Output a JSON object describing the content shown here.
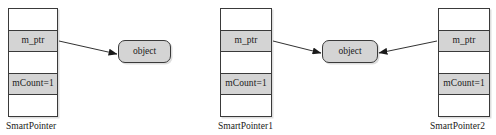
{
  "diagram": {
    "colors": {
      "fill_gray": "#d4d4d4",
      "stroke": "#3a3a3a",
      "background": "#ffffff",
      "text": "#1a1a1a"
    },
    "figures": [
      {
        "id": "single-owner",
        "caption": "SmartPointer",
        "box": {
          "rows": [
            {
              "label": "",
              "filled": false
            },
            {
              "label": "m_ptr",
              "filled": true
            },
            {
              "label": "",
              "filled": false
            },
            {
              "label": "mCount=1",
              "filled": true
            },
            {
              "label": "",
              "filled": false
            }
          ]
        },
        "object": {
          "label": "object"
        }
      },
      {
        "id": "shared-owner",
        "captions": {
          "left": "SmartPointer1",
          "right": "SmartPointer2"
        },
        "box_left": {
          "rows": [
            {
              "label": "",
              "filled": false
            },
            {
              "label": "m_ptr",
              "filled": true
            },
            {
              "label": "",
              "filled": false
            },
            {
              "label": "mCount=1",
              "filled": true
            },
            {
              "label": "",
              "filled": false
            }
          ]
        },
        "box_right": {
          "rows": [
            {
              "label": "",
              "filled": false
            },
            {
              "label": "m_ptr",
              "filled": true
            },
            {
              "label": "",
              "filled": false
            },
            {
              "label": "mCount=1",
              "filled": true
            },
            {
              "label": "",
              "filled": false
            }
          ]
        },
        "object": {
          "label": "object"
        }
      }
    ]
  }
}
